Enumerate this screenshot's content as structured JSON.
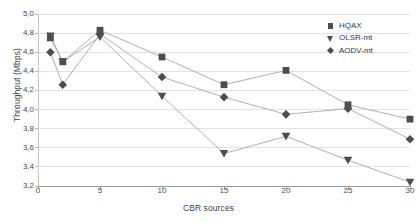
{
  "chart_data": {
    "type": "line",
    "title": "",
    "xlabel": "CBR sources",
    "ylabel": "Throughput (Mbps)",
    "x": [
      1,
      2,
      5,
      10,
      15,
      20,
      25,
      30
    ],
    "xticks": [
      "0",
      "5",
      "10",
      "15",
      "20",
      "25",
      "30"
    ],
    "xtick_values": [
      0,
      5,
      10,
      15,
      20,
      25,
      30
    ],
    "yticks": [
      "3,2",
      "3,4",
      "3,6",
      "3,8",
      "4,0",
      "4,2",
      "4,4",
      "4,6",
      "4,8",
      "5,0"
    ],
    "ytick_values": [
      3.2,
      3.4,
      3.6,
      3.8,
      4.0,
      4.2,
      4.4,
      4.6,
      4.8,
      5.0
    ],
    "xlim": [
      0,
      30
    ],
    "ylim": [
      3.2,
      5.0
    ],
    "grid": "horizontal",
    "legend_position": "top-right",
    "series": [
      {
        "name": "HQAX",
        "marker": "square",
        "color": "#4d4d4d",
        "values": [
          4.75,
          4.5,
          4.83,
          4.55,
          4.26,
          4.41,
          4.05,
          3.9
        ]
      },
      {
        "name": "OLSR-mt",
        "marker": "triangle-down",
        "color": "#4d4d4d",
        "values": [
          4.77,
          4.5,
          4.76,
          4.14,
          3.54,
          3.72,
          3.47,
          3.24
        ]
      },
      {
        "name": "AODV-mt",
        "marker": "diamond",
        "color": "#4d4d4d",
        "values": [
          4.6,
          4.26,
          4.79,
          4.34,
          4.13,
          3.95,
          4.01,
          3.69
        ]
      }
    ]
  },
  "legend": {
    "items": [
      {
        "label": "HQAX",
        "marker": "square"
      },
      {
        "label": "OLSR-mt",
        "marker": "triangle-down"
      },
      {
        "label": "AODV-mt",
        "marker": "diamond"
      }
    ]
  },
  "axes": {
    "x_title": "CBR sources",
    "y_title": "Throughput (Mbps)"
  }
}
